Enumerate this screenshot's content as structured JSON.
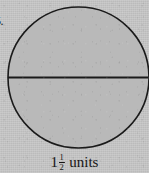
{
  "figure": {
    "item_number": "5.",
    "shape_name": "circle-with-horizontal-diameter",
    "fill_color": "#b9b9b9",
    "stroke_color": "#1a1a1a",
    "background_color": "#c6c6c6",
    "circle": {
      "center_x": 78.5,
      "center_y": 77.5,
      "radius": 70.5,
      "stroke_width": 1.6
    },
    "diameter_line": {
      "label": "horizontal-diameter",
      "x1": 8,
      "y1": 77.5,
      "x2": 149,
      "y2": 77.5,
      "stroke_width": 1.8
    }
  },
  "caption": {
    "full_text": "1 1/2 units",
    "whole_number": "1",
    "fraction_numerator": "1",
    "fraction_denominator": "2",
    "unit_word": "units"
  }
}
